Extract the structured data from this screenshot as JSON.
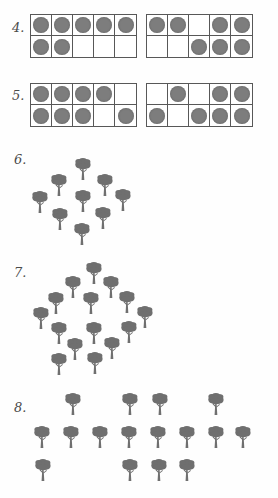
{
  "page": {
    "width": 278,
    "height": 498,
    "background": "#fefefe",
    "ink_color": "#4a4a4a",
    "dot_color": "#7d7d7d",
    "frame_line_color": "#585858",
    "tree_color": "#6f6f6f"
  },
  "problems": [
    {
      "number": "4.",
      "label_x": 12,
      "label_y": 20,
      "type": "ten-frame-pair",
      "y": 14,
      "x": 30,
      "frames": [
        {
          "name": "frame-a",
          "top": [
            true,
            true,
            true,
            true,
            true
          ],
          "bottom": [
            true,
            true,
            false,
            false,
            false
          ],
          "count": 7
        },
        {
          "name": "frame-b",
          "top": [
            true,
            true,
            false,
            true,
            true
          ],
          "bottom": [
            false,
            false,
            true,
            true,
            true
          ],
          "count": 7
        }
      ]
    },
    {
      "number": "5.",
      "label_x": 12,
      "label_y": 88,
      "type": "ten-frame-pair",
      "y": 83,
      "x": 30,
      "frames": [
        {
          "name": "frame-a",
          "top": [
            true,
            true,
            true,
            true,
            false
          ],
          "bottom": [
            true,
            true,
            true,
            false,
            true
          ],
          "count": 8
        },
        {
          "name": "frame-b",
          "top": [
            false,
            true,
            false,
            true,
            true
          ],
          "bottom": [
            true,
            false,
            true,
            true,
            true
          ],
          "count": 7
        }
      ]
    },
    {
      "number": "6.",
      "label_x": 14,
      "label_y": 152,
      "type": "tree-array",
      "count": 9,
      "trees": [
        {
          "x": 73,
          "y": 157
        },
        {
          "x": 49,
          "y": 173
        },
        {
          "x": 95,
          "y": 173
        },
        {
          "x": 30,
          "y": 190
        },
        {
          "x": 73,
          "y": 189
        },
        {
          "x": 113,
          "y": 188
        },
        {
          "x": 50,
          "y": 207
        },
        {
          "x": 93,
          "y": 206
        },
        {
          "x": 72,
          "y": 222
        }
      ]
    },
    {
      "number": "7.",
      "label_x": 14,
      "label_y": 265,
      "type": "tree-array",
      "count": 15,
      "trees": [
        {
          "x": 84,
          "y": 261
        },
        {
          "x": 63,
          "y": 275
        },
        {
          "x": 101,
          "y": 275
        },
        {
          "x": 46,
          "y": 291
        },
        {
          "x": 81,
          "y": 291
        },
        {
          "x": 117,
          "y": 290
        },
        {
          "x": 31,
          "y": 306
        },
        {
          "x": 135,
          "y": 305
        },
        {
          "x": 49,
          "y": 321
        },
        {
          "x": 84,
          "y": 321
        },
        {
          "x": 119,
          "y": 320
        },
        {
          "x": 65,
          "y": 337
        },
        {
          "x": 102,
          "y": 336
        },
        {
          "x": 85,
          "y": 351
        },
        {
          "x": 49,
          "y": 352
        }
      ]
    },
    {
      "number": "8.",
      "label_x": 14,
      "label_y": 400,
      "type": "tree-array",
      "count": 16,
      "trees": [
        {
          "x": 63,
          "y": 392
        },
        {
          "x": 120,
          "y": 392
        },
        {
          "x": 150,
          "y": 392
        },
        {
          "x": 206,
          "y": 392
        },
        {
          "x": 32,
          "y": 425
        },
        {
          "x": 61,
          "y": 425
        },
        {
          "x": 90,
          "y": 425
        },
        {
          "x": 119,
          "y": 425
        },
        {
          "x": 148,
          "y": 425
        },
        {
          "x": 177,
          "y": 425
        },
        {
          "x": 206,
          "y": 425
        },
        {
          "x": 233,
          "y": 425
        },
        {
          "x": 33,
          "y": 458
        },
        {
          "x": 120,
          "y": 458
        },
        {
          "x": 149,
          "y": 458
        },
        {
          "x": 177,
          "y": 458
        }
      ]
    }
  ]
}
